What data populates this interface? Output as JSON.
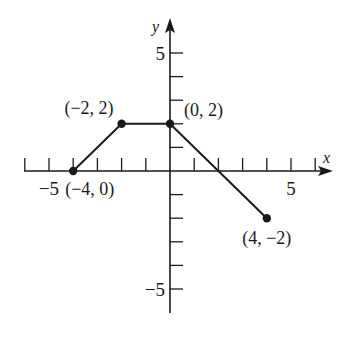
{
  "chart_data": {
    "type": "line",
    "title": "",
    "xlabel": "x",
    "ylabel": "y",
    "xlim": [
      -6,
      6.5
    ],
    "ylim": [
      -6,
      6.5
    ],
    "grid": false,
    "x_ticks": [
      -6,
      -5,
      -4,
      -3,
      -2,
      -1,
      1,
      2,
      3,
      4,
      5,
      6
    ],
    "y_ticks": [
      -5,
      -4,
      -3,
      -2,
      -1,
      1,
      2,
      3,
      4,
      5
    ],
    "x_tick_labels": [
      {
        "value": -5,
        "label": "−5"
      },
      {
        "value": 5,
        "label": "5"
      }
    ],
    "y_tick_labels": [
      {
        "value": 5,
        "label": "5"
      },
      {
        "value": -5,
        "label": "−5"
      }
    ],
    "series": [
      {
        "name": "piecewise",
        "x": [
          -4,
          -2,
          0,
          4
        ],
        "y": [
          0,
          2,
          2,
          -2
        ],
        "point_labels": [
          "(−4, 0)",
          "(−2, 2)",
          "(0, 2)",
          "(4, −2)"
        ]
      }
    ],
    "color": "#1a1a1a"
  }
}
